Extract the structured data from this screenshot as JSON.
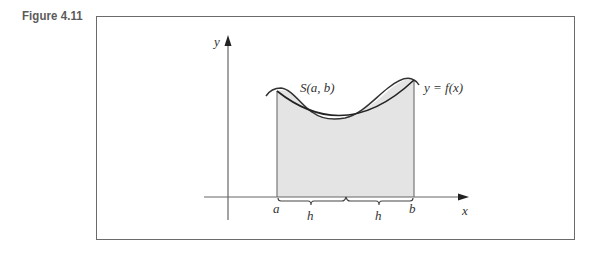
{
  "figure": {
    "label": "Figure 4.11"
  },
  "diagram": {
    "axes": {
      "x_label": "x",
      "y_label": "y"
    },
    "curve_labels": {
      "function": "y = f(x)",
      "parabola": "S(a, b)"
    },
    "points": {
      "a": "a",
      "b": "b"
    },
    "intervals": [
      {
        "label": "h"
      },
      {
        "label": "h"
      }
    ],
    "colors": {
      "fill": "#e4e4e4",
      "curve": "#333333",
      "axis": "#555555",
      "frame": "#6b6b6b"
    }
  }
}
